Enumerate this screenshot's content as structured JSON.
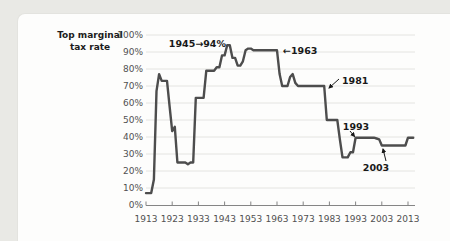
{
  "frame": {
    "background_color": "#e9e9e5",
    "panel_color": "#fdfdfc"
  },
  "chart_data": {
    "type": "line",
    "title": "",
    "xlabel": "",
    "ylabel": "Top marginal tax rate",
    "ylabel_lines": [
      "Top marginal",
      "tax rate"
    ],
    "xlim": [
      1913,
      2015
    ],
    "ylim": [
      0,
      100
    ],
    "grid": "horizontal",
    "legend": "none",
    "xticks": [
      1913,
      1923,
      1933,
      1943,
      1953,
      1963,
      1973,
      1983,
      1993,
      2003,
      2013
    ],
    "yticks": [
      0,
      10,
      20,
      30,
      40,
      50,
      60,
      70,
      80,
      90,
      100
    ],
    "ytick_suffix": "%",
    "colors": {
      "line": "#4d4d4d",
      "grid": "#e4e4e1",
      "axis": "#858585",
      "tick_label": "#515151",
      "annotation": "#191919"
    },
    "series": [
      {
        "name": "Top marginal tax rate (%)",
        "points": [
          [
            1913,
            7
          ],
          [
            1915,
            7
          ],
          [
            1916,
            15
          ],
          [
            1917,
            67
          ],
          [
            1918,
            77
          ],
          [
            1919,
            73
          ],
          [
            1921,
            73
          ],
          [
            1922,
            58
          ],
          [
            1923,
            43.5
          ],
          [
            1924,
            46
          ],
          [
            1925,
            25
          ],
          [
            1928,
            25
          ],
          [
            1929,
            24
          ],
          [
            1930,
            25
          ],
          [
            1931,
            25
          ],
          [
            1932,
            63
          ],
          [
            1935,
            63
          ],
          [
            1936,
            79
          ],
          [
            1939,
            79
          ],
          [
            1940,
            81
          ],
          [
            1941,
            81
          ],
          [
            1942,
            88
          ],
          [
            1943,
            88
          ],
          [
            1944,
            94
          ],
          [
            1945,
            94
          ],
          [
            1946,
            86.5
          ],
          [
            1947,
            86.5
          ],
          [
            1948,
            82
          ],
          [
            1949,
            82
          ],
          [
            1950,
            84.5
          ],
          [
            1951,
            91
          ],
          [
            1952,
            92
          ],
          [
            1953,
            92
          ],
          [
            1954,
            91
          ],
          [
            1963,
            91
          ],
          [
            1964,
            77
          ],
          [
            1965,
            70
          ],
          [
            1967,
            70
          ],
          [
            1968,
            75.3
          ],
          [
            1969,
            77
          ],
          [
            1970,
            71.8
          ],
          [
            1971,
            70
          ],
          [
            1981,
            70
          ],
          [
            1982,
            50
          ],
          [
            1986,
            50
          ],
          [
            1987,
            38.5
          ],
          [
            1988,
            28
          ],
          [
            1990,
            28
          ],
          [
            1991,
            31
          ],
          [
            1992,
            31
          ],
          [
            1993,
            39.6
          ],
          [
            2000,
            39.6
          ],
          [
            2001,
            39.1
          ],
          [
            2002,
            38.6
          ],
          [
            2003,
            35
          ],
          [
            2012,
            35
          ],
          [
            2013,
            39.6
          ],
          [
            2015,
            39.6
          ]
        ]
      }
    ],
    "annotations": [
      {
        "text": "1945→94%",
        "x": 226,
        "y": 47,
        "anchor": "end"
      },
      {
        "text": "←1963",
        "x": 283,
        "y": 54,
        "anchor": "start"
      },
      {
        "text": "1981",
        "x": 342,
        "y": 84,
        "anchor": "start",
        "arrow": {
          "x1": 339,
          "y1": 79,
          "x2": 329,
          "y2": 88
        }
      },
      {
        "text": "1993",
        "x": 356,
        "y": 130,
        "anchor": "middle",
        "arrow": {
          "x1": 350,
          "y1": 131,
          "x2": 354.5,
          "y2": 136.5
        }
      },
      {
        "text": "2003",
        "x": 376,
        "y": 171,
        "anchor": "middle",
        "arrow": {
          "x1": 386,
          "y1": 161,
          "x2": 383,
          "y2": 149
        }
      }
    ]
  }
}
